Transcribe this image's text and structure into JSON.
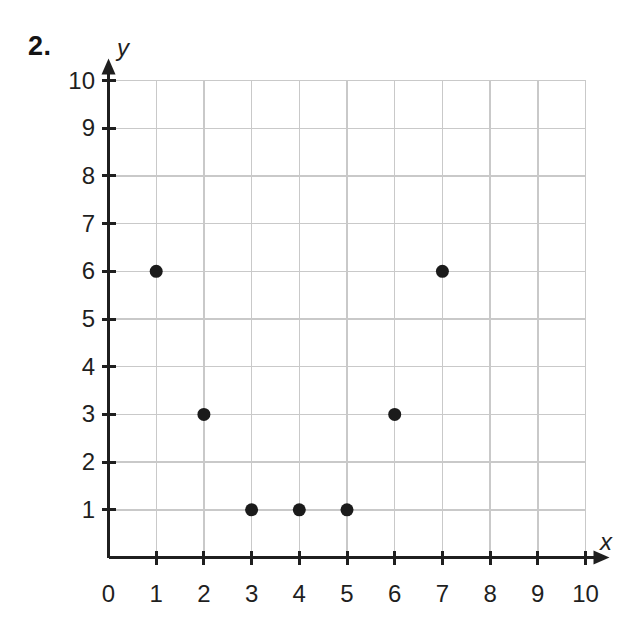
{
  "problem": {
    "number": "2."
  },
  "axes": {
    "x_label": "x",
    "y_label": "y",
    "x_ticks": [
      "0",
      "1",
      "2",
      "3",
      "4",
      "5",
      "6",
      "7",
      "8",
      "9",
      "10"
    ],
    "y_ticks": [
      "1",
      "2",
      "3",
      "4",
      "5",
      "6",
      "7",
      "8",
      "9",
      "10"
    ]
  },
  "colors": {
    "point": "#1b1b1b",
    "gridline": "#c9c9c9",
    "axis": "#1f1f1f",
    "background": "#ffffff"
  },
  "chart_data": {
    "type": "scatter",
    "title": "",
    "xlabel": "x",
    "ylabel": "y",
    "xlim": [
      0,
      10
    ],
    "ylim": [
      0,
      10
    ],
    "grid": true,
    "legend": "none",
    "xticks": [
      0,
      1,
      2,
      3,
      4,
      5,
      6,
      7,
      8,
      9,
      10
    ],
    "yticks": [
      0,
      1,
      2,
      3,
      4,
      5,
      6,
      7,
      8,
      9,
      10
    ],
    "series": [
      {
        "name": "points",
        "marker": "filled-circle",
        "color": "#1b1b1b",
        "points": [
          {
            "x": 1,
            "y": 6
          },
          {
            "x": 2,
            "y": 3
          },
          {
            "x": 3,
            "y": 1
          },
          {
            "x": 4,
            "y": 1
          },
          {
            "x": 5,
            "y": 1
          },
          {
            "x": 6,
            "y": 3
          },
          {
            "x": 7,
            "y": 6
          }
        ]
      }
    ]
  }
}
